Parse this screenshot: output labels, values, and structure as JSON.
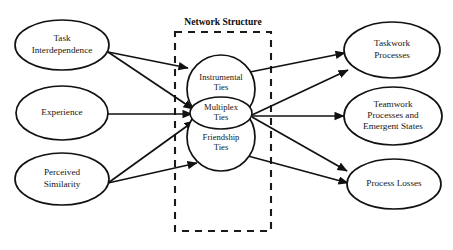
{
  "figure": {
    "title": "",
    "panel": {
      "title": "Network Structure",
      "box": {
        "x": 175,
        "y": 32,
        "width": 96,
        "height": 199
      }
    },
    "predictors": [
      {
        "id": "task-interdependence",
        "lines": [
          "Task",
          "Interdependence"
        ],
        "cx": 62,
        "cy": 45,
        "rx": 47,
        "ry": 25
      },
      {
        "id": "experience",
        "lines": [
          "Experience"
        ],
        "cx": 62,
        "cy": 113,
        "rx": 46,
        "ry": 27
      },
      {
        "id": "perceived-similarity",
        "lines": [
          "Perceived",
          "Similarity"
        ],
        "cx": 62,
        "cy": 179,
        "rx": 47,
        "ry": 26
      }
    ],
    "network_nodes": [
      {
        "id": "instrumental-ties",
        "lines": [
          "Instrumental",
          "Ties"
        ],
        "cx": 221,
        "cy": 89,
        "r": 34
      },
      {
        "id": "friendship-ties",
        "lines": [
          "Friendship",
          "Ties"
        ],
        "cx": 221,
        "cy": 137,
        "r": 34
      },
      {
        "id": "multiplex-ties",
        "lines": [
          "Multiplex",
          "Ties"
        ],
        "cx": 221,
        "cy": 113,
        "rx": 31,
        "ry": 16
      }
    ],
    "outcomes": [
      {
        "id": "taskwork-processes",
        "lines": [
          "Taskwork",
          "Processes"
        ],
        "cx": 392,
        "cy": 50,
        "rx": 48,
        "ry": 28
      },
      {
        "id": "teamwork-processes",
        "lines": [
          "Teamwork",
          "Processes and",
          "Emergent States"
        ],
        "cx": 393,
        "cy": 116,
        "rx": 49,
        "ry": 29
      },
      {
        "id": "process-losses",
        "lines": [
          "Process Losses"
        ],
        "cx": 394,
        "cy": 184,
        "rx": 47,
        "ry": 25
      }
    ],
    "arrows": [
      {
        "id": "task-to-instrumental",
        "from": "task-interdependence",
        "to": "instrumental-ties",
        "x1": 108,
        "y1": 52,
        "x2": 188,
        "y2": 68
      },
      {
        "id": "task-to-multiplex",
        "from": "task-interdependence",
        "to": "multiplex-ties",
        "x1": 108,
        "y1": 52,
        "x2": 193,
        "y2": 109
      },
      {
        "id": "experience-to-multiplex",
        "from": "experience",
        "to": "multiplex-ties",
        "x1": 108,
        "y1": 114,
        "x2": 192,
        "y2": 114
      },
      {
        "id": "similarity-to-multiplex",
        "from": "perceived-similarity",
        "to": "multiplex-ties",
        "x1": 108,
        "y1": 183,
        "x2": 194,
        "y2": 121
      },
      {
        "id": "similarity-to-friendship",
        "from": "perceived-similarity",
        "to": "friendship-ties",
        "x1": 108,
        "y1": 183,
        "x2": 197,
        "y2": 163
      },
      {
        "id": "instrumental-to-taskwork",
        "from": "instrumental-ties",
        "to": "taskwork-processes",
        "x1": 250,
        "y1": 72,
        "x2": 345,
        "y2": 53
      },
      {
        "id": "multiplex-to-taskwork",
        "from": "multiplex-ties",
        "to": "taskwork-processes",
        "x1": 252,
        "y1": 115,
        "x2": 348,
        "y2": 70
      },
      {
        "id": "multiplex-to-teamwork",
        "from": "multiplex-ties",
        "to": "teamwork-processes",
        "x1": 252,
        "y1": 116,
        "x2": 344,
        "y2": 116
      },
      {
        "id": "multiplex-to-process-losses",
        "from": "multiplex-ties",
        "to": "process-losses",
        "x1": 252,
        "y1": 117,
        "x2": 347,
        "y2": 171
      },
      {
        "id": "friendship-to-process-losses",
        "from": "friendship-ties",
        "to": "process-losses",
        "x1": 248,
        "y1": 156,
        "x2": 348,
        "y2": 183
      }
    ]
  }
}
